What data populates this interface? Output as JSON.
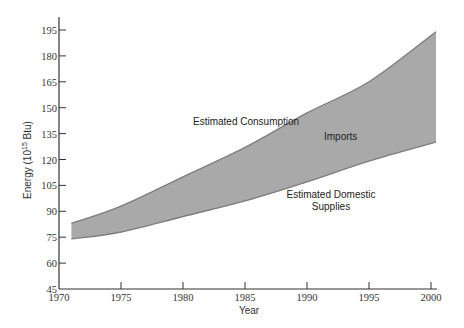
{
  "chart_data": {
    "type": "area",
    "title": "",
    "xlabel": "Year",
    "ylabel": "Energy (10^15 Btu)",
    "ylabel_parts": {
      "prefix": "Energy (10",
      "sup": "15",
      "suffix": " Btu)"
    },
    "xlim": [
      1970,
      2000
    ],
    "ylim": [
      45,
      195
    ],
    "x_ticks": [
      1970,
      1975,
      1980,
      1985,
      1990,
      1995,
      2000
    ],
    "y_ticks": [
      45,
      60,
      75,
      90,
      105,
      120,
      135,
      150,
      165,
      180,
      195
    ],
    "grid": false,
    "legend": null,
    "x": [
      1971,
      1975,
      1980,
      1985,
      1990,
      1995,
      2000
    ],
    "series": [
      {
        "name": "Estimated Consumption",
        "values": [
          83,
          93,
          110,
          127,
          147,
          165,
          194
        ]
      },
      {
        "name": "Estimated Domestic Supplies",
        "values": [
          74,
          78,
          87,
          96,
          107,
          119,
          130
        ]
      }
    ],
    "band": {
      "between": [
        "Estimated Consumption",
        "Estimated Domestic Supplies"
      ],
      "label": "Imports",
      "fill": "#a9a9a9",
      "edge": "#7d7d7d"
    },
    "annotations": [
      {
        "text": "Estimated Consumption",
        "x": 193,
        "y": 125
      },
      {
        "text": "Imports",
        "x": 324,
        "y": 140
      },
      {
        "text": "Estimated Domestic",
        "x": 331,
        "y": 198
      },
      {
        "text": "Supplies",
        "x": 331,
        "y": 210
      }
    ]
  },
  "labels": {
    "consumption": "Estimated Consumption",
    "imports": "Imports",
    "domestic_line1": "Estimated Domestic",
    "domestic_line2": "Supplies",
    "xlabel": "Year"
  }
}
